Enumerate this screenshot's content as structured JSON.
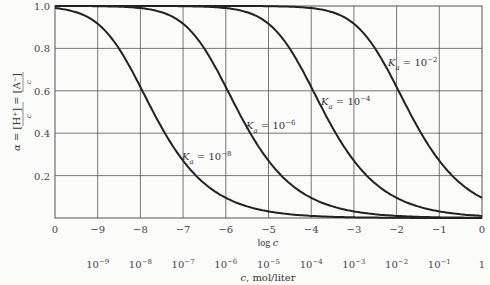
{
  "chart_data": {
    "type": "line",
    "title": "",
    "xlabel": "log c",
    "xlabel2": "c, mol/liter",
    "ylabel": "α = [H⁺]/c = [A⁻]/c",
    "xlim": [
      -10,
      0
    ],
    "ylim": [
      0,
      1.0
    ],
    "grid": true,
    "x_ticks": [
      "0",
      "−9",
      "−8",
      "−7",
      "−6",
      "−5",
      "−4",
      "−3",
      "−2",
      "−1",
      "0"
    ],
    "x2_ticks": [
      {
        "base": "10",
        "exp": "−9"
      },
      {
        "base": "10",
        "exp": "−8"
      },
      {
        "base": "10",
        "exp": "−7"
      },
      {
        "base": "10",
        "exp": "−6"
      },
      {
        "base": "10",
        "exp": "−5"
      },
      {
        "base": "10",
        "exp": "−4"
      },
      {
        "base": "10",
        "exp": "−3"
      },
      {
        "base": "10",
        "exp": "−2"
      },
      {
        "base": "10",
        "exp": "−1"
      },
      {
        "base": "1",
        "exp": ""
      }
    ],
    "y_ticks": [
      "0.2",
      "0.4",
      "0.6",
      "0.8",
      "1.0"
    ],
    "series": [
      {
        "name": "Ka = 10^-8",
        "log_Ka": -8,
        "label": "K_a = 10^−8",
        "points": [
          [
            -10,
            0.99
          ],
          [
            -9,
            0.92
          ],
          [
            -8,
            0.62
          ],
          [
            -7,
            0.27
          ],
          [
            -6,
            0.095
          ],
          [
            -5,
            0.031
          ],
          [
            -4,
            0.01
          ]
        ]
      },
      {
        "name": "Ka = 10^-6",
        "log_Ka": -6,
        "label": "K_a = 10^−6",
        "points": [
          [
            -8,
            0.99
          ],
          [
            -7,
            0.92
          ],
          [
            -6,
            0.62
          ],
          [
            -5,
            0.27
          ],
          [
            -4,
            0.095
          ],
          [
            -3,
            0.031
          ],
          [
            -2,
            0.01
          ]
        ]
      },
      {
        "name": "Ka = 10^-4",
        "log_Ka": -4,
        "label": "K_a = 10^−4",
        "points": [
          [
            -6,
            0.99
          ],
          [
            -5,
            0.92
          ],
          [
            -4,
            0.62
          ],
          [
            -3,
            0.27
          ],
          [
            -2,
            0.095
          ],
          [
            -1,
            0.031
          ],
          [
            0,
            0.01
          ]
        ]
      },
      {
        "name": "Ka = 10^-2",
        "log_Ka": -2,
        "label": "K_a = 10^−2",
        "points": [
          [
            -4,
            0.99
          ],
          [
            -3,
            0.92
          ],
          [
            -2,
            0.62
          ],
          [
            -1,
            0.27
          ],
          [
            0,
            0.095
          ]
        ]
      }
    ],
    "labels": [
      {
        "text": "K",
        "sub": "a",
        "rest": " = 10",
        "exp": "−8"
      },
      {
        "text": "K",
        "sub": "a",
        "rest": " = 10",
        "exp": "−6"
      },
      {
        "text": "K",
        "sub": "a",
        "rest": " = 10",
        "exp": "−4"
      },
      {
        "text": "K",
        "sub": "a",
        "rest": " = 10",
        "exp": "−2"
      }
    ]
  }
}
